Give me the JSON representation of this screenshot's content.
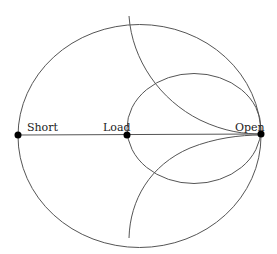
{
  "diagram": {
    "type": "smith-chart",
    "stroke_color": "#555555",
    "point_color": "#000000",
    "labels": {
      "short": "Short",
      "load": "Load",
      "open": "Open"
    },
    "points": [
      {
        "name": "short",
        "x": 18,
        "y": 135
      },
      {
        "name": "load",
        "x": 127,
        "y": 135
      },
      {
        "name": "open",
        "x": 261,
        "y": 135
      }
    ]
  }
}
